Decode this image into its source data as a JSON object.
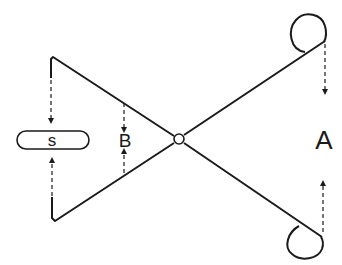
{
  "diagram": {
    "colors": {
      "stroke": "#1a1a1a",
      "background": "#ffffff"
    },
    "labels": {
      "s": "s",
      "b": "B",
      "a": "A"
    },
    "elements": [
      {
        "name": "pivot",
        "shape": "circle"
      },
      {
        "name": "upper-arm",
        "shape": "polyline"
      },
      {
        "name": "lower-arm",
        "shape": "polyline"
      },
      {
        "name": "upper-loop",
        "shape": "loop"
      },
      {
        "name": "lower-loop",
        "shape": "loop"
      },
      {
        "name": "s-capsule",
        "shape": "rounded-rect"
      },
      {
        "name": "arrow-left-top",
        "direction": "down",
        "style": "dashed"
      },
      {
        "name": "arrow-left-bottom",
        "direction": "up",
        "style": "dashed"
      },
      {
        "name": "arrow-b-top",
        "direction": "down",
        "style": "dashed"
      },
      {
        "name": "arrow-b-bottom",
        "direction": "up",
        "style": "dashed"
      },
      {
        "name": "arrow-right-top",
        "direction": "down",
        "style": "dashed"
      },
      {
        "name": "arrow-right-bottom",
        "direction": "up",
        "style": "dashed"
      }
    ]
  }
}
